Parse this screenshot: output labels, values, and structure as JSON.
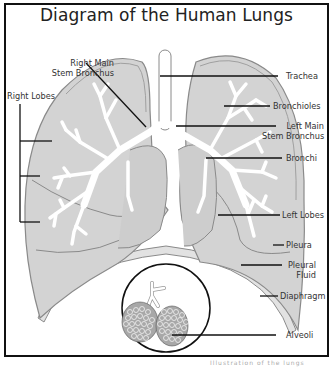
{
  "title": "Diagram of the Human Lungs",
  "labels": {
    "right_main_stem_bronchus": "Right Main\nStem Bronchus",
    "right_main_line1": "Right Main",
    "right_main_line2": "Stem Bronchus",
    "right_lobes": "Right Lobes",
    "trachea": "Trachea",
    "bronchioles": "Bronchioles",
    "left_main_line1": "Left Main",
    "left_main_line2": "Stem Bronchus",
    "bronchi": "Bronchi",
    "left_lobes": "Left Lobes",
    "pleura": "Pleura",
    "pleural_fluid_line1": "Pleural",
    "pleural_fluid_line2": "Fluid",
    "diaphragm": "Diaphragm",
    "alveoli": "Alveoli"
  },
  "colors": {
    "lung_fill": "#d3d3d3",
    "lung_outline": "#8a8a8a",
    "airway_fill": "#ffffff",
    "leader_line": "#111111",
    "frame": "#111111"
  },
  "caption": "Illustration of the lungs"
}
